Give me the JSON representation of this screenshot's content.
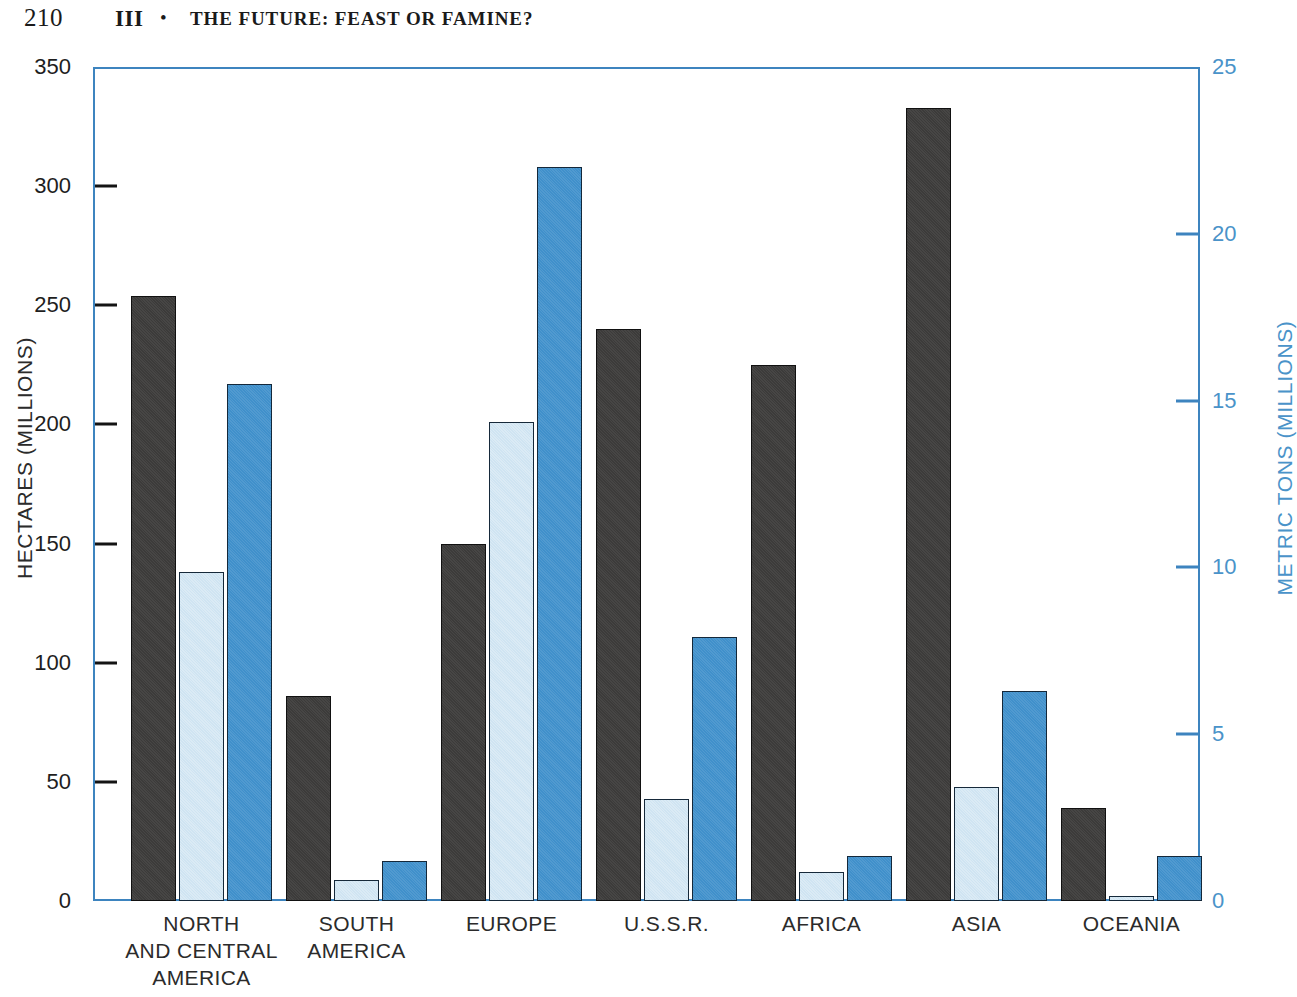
{
  "running_head": {
    "page_number": "210",
    "part": "III",
    "bullet": "•",
    "title": "THE FUTURE: FEAST OR FAMINE?"
  },
  "chart_data": {
    "type": "bar",
    "title": "",
    "xlabel": "",
    "ylabel": "HECTARES (MILLIONS)",
    "y2label": "METRIC TONS (MILLIONS)",
    "ylim": [
      0,
      350
    ],
    "y2lim": [
      0,
      25
    ],
    "yticks": [
      0,
      50,
      100,
      150,
      200,
      250,
      300,
      350
    ],
    "y2ticks": [
      0,
      5,
      10,
      15,
      20,
      25
    ],
    "ytick_labels": [
      "0",
      "50",
      "100",
      "150",
      "200",
      "250",
      "300",
      "350"
    ],
    "y2tick_labels": [
      "0",
      "5",
      "10",
      "15",
      "20",
      "25"
    ],
    "grid": false,
    "legend_position": "none",
    "categories": [
      "NORTH\nAND CENTRAL\nAMERICA",
      "SOUTH\nAMERICA",
      "EUROPE",
      "U.S.S.R.",
      "AFRICA",
      "ASIA",
      "OCEANIA"
    ],
    "category_lines": [
      [
        "NORTH",
        "AND CENTRAL",
        "AMERICA"
      ],
      [
        "SOUTH",
        "AMERICA"
      ],
      [
        "EUROPE"
      ],
      [
        "U.S.S.R."
      ],
      [
        "AFRICA"
      ],
      [
        "ASIA"
      ],
      [
        "OCEANIA"
      ]
    ],
    "series": [
      {
        "name": "dark-series",
        "axis": "left",
        "units": "hectares (millions)",
        "color": "#3c3b3a",
        "values": [
          254,
          86,
          150,
          240,
          225,
          333,
          39
        ]
      },
      {
        "name": "pale-blue-series",
        "axis": "left",
        "units": "hectares (millions)",
        "color": "#cfe4f2",
        "values": [
          138,
          9,
          201,
          43,
          12,
          48,
          2
        ]
      },
      {
        "name": "blue-series",
        "axis": "right",
        "units": "metric tons (millions)",
        "color": "#4090cb",
        "values": [
          15.5,
          1.2,
          22.0,
          7.9,
          1.35,
          6.3,
          1.35
        ]
      }
    ]
  },
  "colors": {
    "axis_blue": "#3d84bf",
    "dark_bar": "#3c3b3a",
    "pale_bar": "#cfe4f2",
    "blue_bar": "#4090cb",
    "text": "#2b2b2b"
  }
}
